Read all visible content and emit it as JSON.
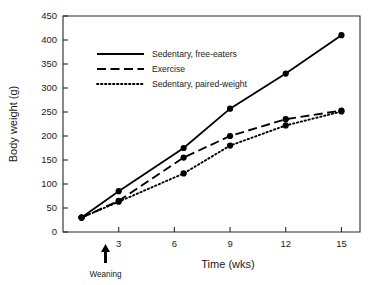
{
  "chart_data": {
    "type": "line",
    "title": "",
    "xlabel": "Time (wks)",
    "ylabel": "Body weight (g)",
    "xlim": [
      0,
      16
    ],
    "ylim": [
      0,
      450
    ],
    "xticks": [
      3,
      6,
      9,
      12,
      15
    ],
    "yticks": [
      0,
      50,
      100,
      150,
      200,
      250,
      300,
      350,
      400,
      450
    ],
    "grid": false,
    "legend_position": "upper-left-inside",
    "annotations": [
      {
        "text": "Weaning",
        "x": 3,
        "y": 0,
        "marker": "up-arrow"
      }
    ],
    "series": [
      {
        "name": "Sedentary, free-eaters",
        "style": "solid",
        "x": [
          1,
          3,
          6.5,
          9,
          12,
          15
        ],
        "values": [
          30,
          85,
          175,
          257,
          330,
          410
        ]
      },
      {
        "name": "Exercise",
        "style": "dashed",
        "x": [
          1,
          3,
          6.5,
          9,
          12,
          15
        ],
        "values": [
          30,
          65,
          155,
          200,
          235,
          253
        ]
      },
      {
        "name": "Sedentary, paired-weight",
        "style": "dotted",
        "x": [
          1,
          3,
          6.5,
          9,
          12,
          15
        ],
        "values": [
          30,
          63,
          122,
          180,
          222,
          251
        ]
      }
    ]
  },
  "axes": {
    "xlabel": "Time (wks)",
    "ylabel": "Body weight (g)"
  },
  "legend": {
    "items": [
      {
        "label": "Sedentary, free-eaters"
      },
      {
        "label": "Exercise"
      },
      {
        "label": "Sedentary, paired-weight"
      }
    ]
  },
  "annotation": {
    "weaning": "Weaning"
  },
  "colors": {
    "ink": "#000000",
    "axis": "#2b2b2b",
    "background": "#ffffff"
  }
}
